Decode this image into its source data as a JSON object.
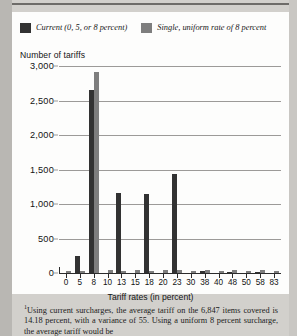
{
  "legend": {
    "series": [
      {
        "label": "Current (0, 5, or 8 percent)",
        "color": "#323232",
        "swatch_name": "legend-swatch-current"
      },
      {
        "label": "Single, uniform rate of 8 percent",
        "color": "#7e7e7e",
        "swatch_name": "legend-swatch-uniform"
      }
    ]
  },
  "axis": {
    "y_title": "Number of tariffs",
    "x_title": "Tariff rates (in percent)"
  },
  "footnote": {
    "marker": "1",
    "text": "Using current surcharges, the average tariff on the 6,847 items covered is 14.18 percent, with a variance of 55. Using a uniform 8 percent surcharge, the average tariff would be"
  },
  "chart_data": {
    "type": "bar",
    "title": "",
    "subtitle": "",
    "xlabel": "Tariff rates (in percent)",
    "ylabel": "Number of tariffs",
    "ylim": [
      0,
      3000
    ],
    "yticks": [
      "0",
      "500",
      "1,000",
      "1,500",
      "2,000",
      "2,500",
      "3,000"
    ],
    "ytick_values": [
      0,
      500,
      1000,
      1500,
      2000,
      2500,
      3000
    ],
    "grid": true,
    "legend_position": "top",
    "categories": [
      "0",
      "5",
      "8",
      "10",
      "13",
      "15",
      "18",
      "20",
      "23",
      "30",
      "38",
      "40",
      "48",
      "50",
      "58",
      "83"
    ],
    "series": [
      {
        "name": "Current (0, 5, or 8 percent)",
        "color": "#323232",
        "values": [
          0,
          250,
          2650,
          0,
          1160,
          0,
          1145,
          0,
          1430,
          0,
          25,
          0,
          15,
          0,
          12,
          0
        ]
      },
      {
        "name": "Single, uniform rate of 8 percent",
        "color": "#7e7e7e",
        "values": [
          30,
          30,
          2910,
          40,
          35,
          45,
          30,
          40,
          45,
          30,
          40,
          30,
          40,
          35,
          45,
          30
        ]
      }
    ]
  }
}
